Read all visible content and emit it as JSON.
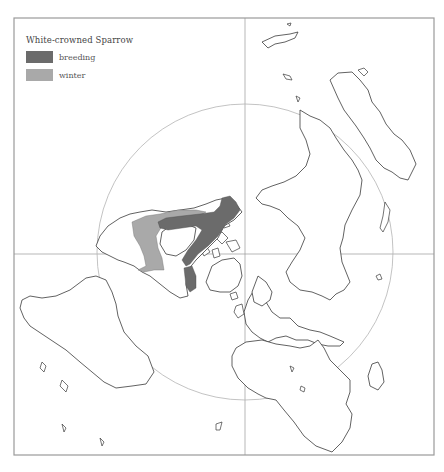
{
  "legend": {
    "title": "White-crowned Sparrow",
    "items": [
      {
        "label": "breeding",
        "color": "#6b6b6b"
      },
      {
        "label": "winter",
        "color": "#a9a9a9"
      }
    ]
  },
  "map": {
    "projection": "polar azimuthal, North Pole centered",
    "frame_color": "#9a9a9a",
    "land_stroke": "#3a3a3a",
    "range_colors": {
      "breeding": "#6b6b6b",
      "winter": "#a9a9a9"
    }
  }
}
